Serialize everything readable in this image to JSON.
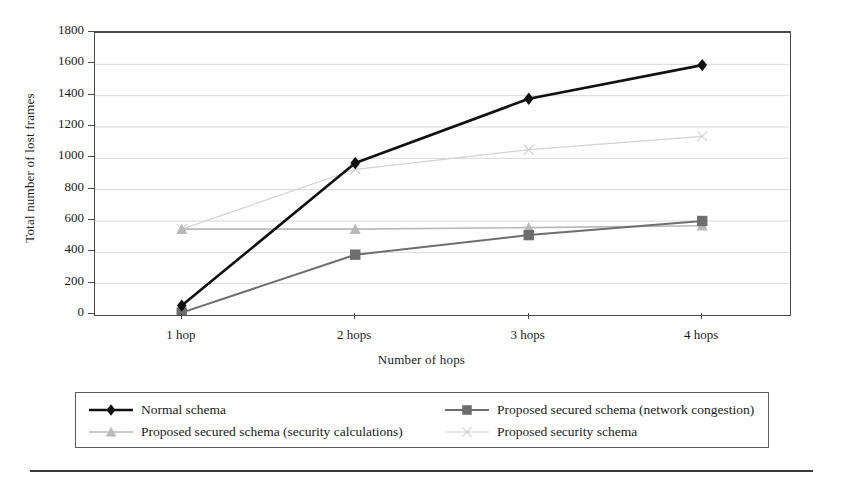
{
  "chart_data": {
    "type": "line",
    "title": "",
    "xlabel": "Number of hops",
    "ylabel": "Total number of lost frames",
    "categories": [
      "1 hop",
      "2 hops",
      "3 hops",
      "4 hops"
    ],
    "ylim": [
      0,
      1800
    ],
    "ytick_step": 200,
    "yticks": [
      1800,
      1600,
      1400,
      1200,
      1000,
      800,
      600,
      400,
      200,
      0
    ],
    "grid": true,
    "grid_axis": "y",
    "legend_position": "bottom",
    "series": [
      {
        "name": "Normal schema",
        "values": [
          60,
          970,
          1380,
          1595
        ],
        "color": "#111111",
        "marker": "diamond",
        "line_width": 2.6
      },
      {
        "name": "Proposed secured schema (network congestion)",
        "values": [
          15,
          385,
          510,
          600
        ],
        "color": "#6e6e6e",
        "marker": "square",
        "line_width": 2.0
      },
      {
        "name": "Proposed secured schema (security calculations)",
        "values": [
          548,
          548,
          558,
          570
        ],
        "color": "#b9b9b9",
        "marker": "triangle",
        "line_width": 1.6
      },
      {
        "name": "Proposed security schema",
        "values": [
          548,
          930,
          1055,
          1140
        ],
        "color": "#d2d2d2",
        "marker": "cross",
        "line_width": 1.2
      }
    ]
  },
  "legend": {
    "columns": [
      [
        "Normal schema",
        "Proposed secured schema (security calculations)"
      ],
      [
        "Proposed secured schema (network congestion)",
        "Proposed security schema"
      ]
    ]
  },
  "colors": {
    "plot_border": "#4a4a4a",
    "gridline": "#d8d8d8",
    "legend_border": "#5a5a5a",
    "rule": "#3a3a3a"
  }
}
